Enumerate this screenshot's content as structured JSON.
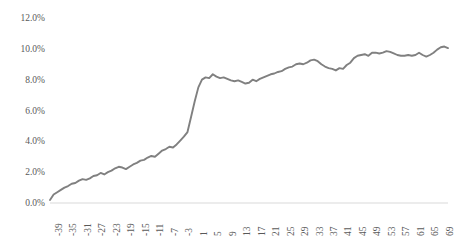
{
  "chart_data": {
    "type": "line",
    "title": "",
    "subtitle": "",
    "xlabel": "",
    "ylabel": "",
    "grid": false,
    "legend": false,
    "legend_position": "none",
    "series_color": "#808080",
    "axis_color": "#d9d9d9",
    "tick_label_color": "#595959",
    "ylim": [
      0,
      12
    ],
    "ytick_labels": [
      "0.0%",
      "2.0%",
      "4.0%",
      "6.0%",
      "8.0%",
      "10.0%",
      "12.0%"
    ],
    "ytick_values": [
      0,
      2,
      4,
      6,
      8,
      10,
      12
    ],
    "xlim": [
      -39,
      71
    ],
    "xtick_labels": [
      "-39",
      "-35",
      "-31",
      "-27",
      "-23",
      "-19",
      "-15",
      "-11",
      "-7",
      "-3",
      "1",
      "5",
      "9",
      "13",
      "17",
      "21",
      "25",
      "29",
      "33",
      "37",
      "41",
      "45",
      "49",
      "53",
      "57",
      "61",
      "65",
      "69"
    ],
    "xtick_values": [
      -39,
      -35,
      -31,
      -27,
      -23,
      -19,
      -15,
      -11,
      -7,
      -3,
      1,
      5,
      9,
      13,
      17,
      21,
      25,
      29,
      33,
      37,
      41,
      45,
      49,
      53,
      57,
      61,
      65,
      69
    ],
    "x": [
      -39,
      -38,
      -37,
      -36,
      -35,
      -34,
      -33,
      -32,
      -31,
      -30,
      -29,
      -28,
      -27,
      -26,
      -25,
      -24,
      -23,
      -22,
      -21,
      -20,
      -19,
      -18,
      -17,
      -16,
      -15,
      -14,
      -13,
      -12,
      -11,
      -10,
      -9,
      -8,
      -7,
      -6,
      -5,
      -4,
      -3,
      -2,
      -1,
      0,
      1,
      2,
      3,
      4,
      5,
      6,
      7,
      8,
      9,
      10,
      11,
      12,
      13,
      14,
      15,
      16,
      17,
      18,
      19,
      20,
      21,
      22,
      23,
      24,
      25,
      26,
      27,
      28,
      29,
      30,
      31,
      32,
      33,
      34,
      35,
      36,
      37,
      38,
      39,
      40,
      41,
      42,
      43,
      44,
      45,
      46,
      47,
      48,
      49,
      50,
      51,
      52,
      53,
      54,
      55,
      56,
      57,
      58,
      59,
      60,
      61,
      62,
      63,
      64,
      65,
      66,
      67,
      68,
      69,
      70,
      71
    ],
    "values": [
      0.2,
      0.55,
      0.7,
      0.85,
      1.0,
      1.1,
      1.25,
      1.3,
      1.45,
      1.55,
      1.5,
      1.6,
      1.75,
      1.8,
      1.95,
      1.85,
      2.0,
      2.1,
      2.25,
      2.35,
      2.3,
      2.2,
      2.35,
      2.5,
      2.6,
      2.75,
      2.8,
      2.95,
      3.05,
      3.0,
      3.2,
      3.4,
      3.5,
      3.65,
      3.6,
      3.8,
      4.05,
      4.3,
      4.6,
      5.6,
      6.6,
      7.5,
      8.0,
      8.15,
      8.1,
      8.35,
      8.2,
      8.1,
      8.15,
      8.05,
      7.95,
      7.9,
      7.95,
      7.85,
      7.75,
      7.8,
      8.0,
      7.9,
      8.05,
      8.15,
      8.25,
      8.35,
      8.4,
      8.5,
      8.55,
      8.7,
      8.8,
      8.85,
      9.0,
      9.05,
      9.0,
      9.1,
      9.25,
      9.3,
      9.2,
      9.0,
      8.85,
      8.75,
      8.7,
      8.6,
      8.75,
      8.7,
      8.95,
      9.1,
      9.4,
      9.55,
      9.6,
      9.65,
      9.55,
      9.75,
      9.75,
      9.7,
      9.75,
      9.85,
      9.8,
      9.7,
      9.6,
      9.55,
      9.55,
      9.6,
      9.55,
      9.6,
      9.75,
      9.6,
      9.5,
      9.6,
      9.75,
      9.95,
      10.1,
      10.15,
      10.05
    ]
  },
  "axis": {
    "y_labels": [
      "12.0%",
      "10.0%",
      "8.0%",
      "6.0%",
      "4.0%",
      "2.0%",
      "0.0%"
    ],
    "x_labels": [
      "-39",
      "-35",
      "-31",
      "-27",
      "-23",
      "-19",
      "-15",
      "-11",
      "-7",
      "-3",
      "1",
      "5",
      "9",
      "13",
      "17",
      "21",
      "25",
      "29",
      "33",
      "37",
      "41",
      "45",
      "49",
      "53",
      "57",
      "61",
      "65",
      "69"
    ]
  }
}
